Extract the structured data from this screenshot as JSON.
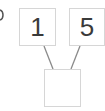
{
  "diagram": {
    "type": "number-bond",
    "parts": [
      {
        "label": "1"
      },
      {
        "label": "5"
      }
    ],
    "whole": {
      "label": ""
    },
    "colors": {
      "box_border": "#d6d6d6",
      "connector": "#8a8a8a",
      "text": "#3a3a3a"
    }
  }
}
